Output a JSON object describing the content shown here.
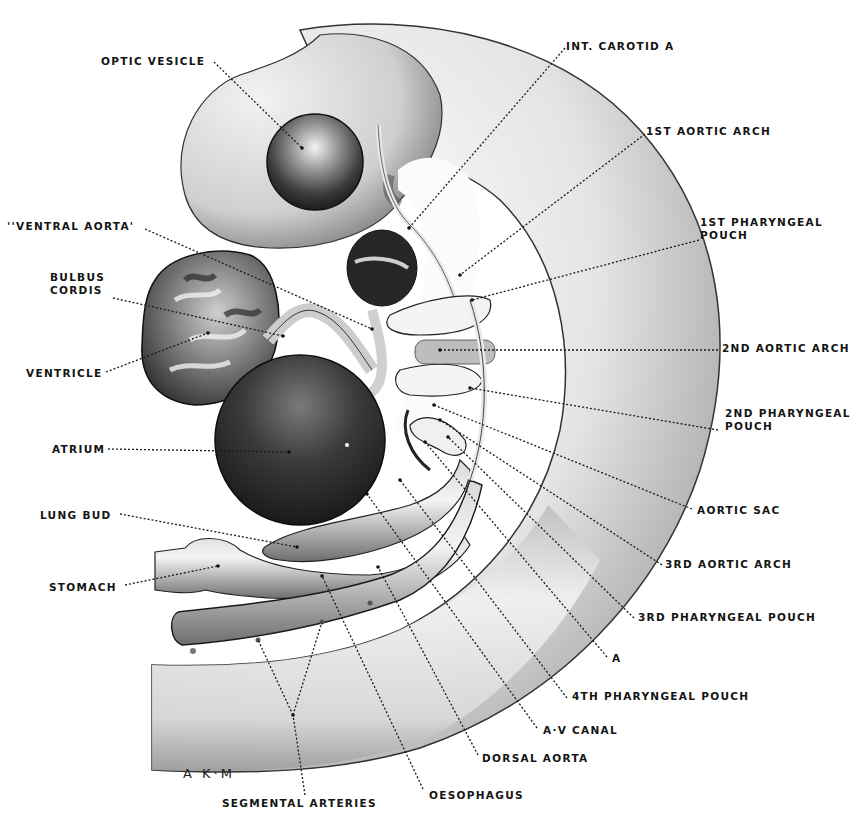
{
  "figure": {
    "signature": "A K·M",
    "colors": {
      "ink": "#141414",
      "paper": "#ffffff",
      "dark_tissue": "#2a2a2a",
      "mid_tissue": "#8a8a8a",
      "light_tissue": "#e6e6e6"
    }
  },
  "labels": [
    {
      "id": "optic-vesicle",
      "text": "OPTIC VESICLE",
      "x": 101,
      "y": 55,
      "anchor": [
        214,
        62
      ],
      "target": [
        302,
        148
      ]
    },
    {
      "id": "int-carotid-a",
      "text": "INT. CAROTID A",
      "x": 566,
      "y": 40,
      "anchor": [
        565,
        48
      ],
      "target": [
        409,
        228
      ]
    },
    {
      "id": "1st-aortic-arch",
      "text": "1ST AORTIC ARCH",
      "x": 646,
      "y": 125,
      "anchor": [
        645,
        134
      ],
      "target": [
        460,
        275
      ]
    },
    {
      "id": "1st-pharyngeal-pouch",
      "text": "1ST PHARYNGEAL",
      "text2": "POUCH",
      "x": 700,
      "y": 216,
      "anchor": [
        699,
        240
      ],
      "target": [
        472,
        300
      ]
    },
    {
      "id": "ventral-aorta",
      "text": "''VENTRAL AORTA'",
      "x": 7,
      "y": 220,
      "anchor": [
        145,
        229
      ],
      "target": [
        372,
        329
      ]
    },
    {
      "id": "bulbus-cordis",
      "text": "BULBUS",
      "text2": "CORDIS",
      "x": 50,
      "y": 271,
      "anchor": [
        113,
        298
      ],
      "target": [
        283,
        336
      ]
    },
    {
      "id": "ventricle",
      "text": "VENTRICLE",
      "x": 26,
      "y": 367,
      "anchor": [
        106,
        372
      ],
      "target": [
        208,
        333
      ]
    },
    {
      "id": "atrium",
      "text": "ATRIUM",
      "x": 52,
      "y": 443,
      "anchor": [
        108,
        449
      ],
      "target": [
        289,
        452
      ]
    },
    {
      "id": "lung-bud",
      "text": "LUNG BUD",
      "x": 40,
      "y": 509,
      "anchor": [
        120,
        514
      ],
      "target": [
        297,
        547
      ]
    },
    {
      "id": "stomach",
      "text": "STOMACH",
      "x": 49,
      "y": 581,
      "anchor": [
        125,
        585
      ],
      "target": [
        218,
        566
      ]
    },
    {
      "id": "2nd-aortic-arch",
      "text": "2ND AORTIC ARCH",
      "x": 722,
      "y": 342,
      "anchor": [
        718,
        350
      ],
      "target": [
        440,
        350
      ]
    },
    {
      "id": "2nd-pharyngeal-pouch",
      "text": "2ND PHARYNGEAL",
      "text2": "POUCH",
      "x": 725,
      "y": 407,
      "anchor": [
        718,
        430
      ],
      "target": [
        470,
        388
      ]
    },
    {
      "id": "aortic-sac",
      "text": "AORTIC SAC",
      "x": 697,
      "y": 504,
      "anchor": [
        692,
        509
      ],
      "target": [
        434,
        405
      ]
    },
    {
      "id": "3rd-aortic-arch",
      "text": "3RD AORTIC ARCH",
      "x": 665,
      "y": 558,
      "anchor": [
        662,
        565
      ],
      "target": [
        440,
        420
      ]
    },
    {
      "id": "3rd-pharyngeal-pouch",
      "text": "3RD PHARYNGEAL POUCH",
      "x": 638,
      "y": 611,
      "anchor": [
        634,
        618
      ],
      "target": [
        448,
        437
      ]
    },
    {
      "id": "a",
      "text": "A",
      "x": 612,
      "y": 652,
      "anchor": [
        607,
        657
      ],
      "target": [
        425,
        442
      ]
    },
    {
      "id": "4th-pharyngeal-pouch",
      "text": "4TH PHARYNGEAL POUCH",
      "x": 572,
      "y": 690,
      "anchor": [
        567,
        698
      ],
      "target": [
        400,
        480
      ]
    },
    {
      "id": "a-v-canal",
      "text": "A·V CANAL",
      "x": 543,
      "y": 724,
      "anchor": [
        537,
        728
      ],
      "target": [
        367,
        494
      ]
    },
    {
      "id": "dorsal-aorta",
      "text": "DORSAL AORTA",
      "x": 482,
      "y": 752,
      "anchor": [
        478,
        755
      ],
      "target": [
        378,
        567
      ]
    },
    {
      "id": "oesophagus",
      "text": "OESOPHAGUS",
      "x": 429,
      "y": 789,
      "anchor": [
        423,
        789
      ],
      "target": [
        322,
        576
      ]
    },
    {
      "id": "segmental-arteries",
      "text": "SEGMENTAL ARTERIES",
      "x": 222,
      "y": 797,
      "anchor": [
        305,
        795
      ],
      "target": [
        293,
        715
      ],
      "branches": [
        [
          258,
          640
        ],
        [
          322,
          622
        ]
      ]
    }
  ]
}
